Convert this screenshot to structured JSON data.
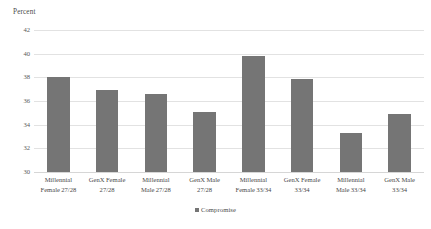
{
  "chart_data": {
    "type": "bar",
    "title": "",
    "subtitle": "",
    "xlabel": "",
    "ylabel": "Percent",
    "ylim": [
      30,
      42
    ],
    "ytick_step": 2,
    "yticks": [
      30,
      32,
      34,
      36,
      38,
      40,
      42
    ],
    "ytick_labels": [
      "30",
      "32",
      "34",
      "36",
      "38",
      "40",
      "42"
    ],
    "grid": true,
    "grid_axis": "y",
    "legend_position": "bottom-center",
    "categories": [
      "Millennial Female 27/28",
      "GenX Female 27/28",
      "Millennial Male 27/28",
      "GenX Male 27/28",
      "Millennial Female 33/34",
      "GenX Female 33/34",
      "Millennial Male 33/34",
      "GenX Male 33/34"
    ],
    "category_lines": [
      [
        "Millennial",
        "Female 27/28"
      ],
      [
        "GenX Female",
        "27/28"
      ],
      [
        "Millennial",
        "Male 27/28"
      ],
      [
        "GenX Male",
        "27/28"
      ],
      [
        "Millennial",
        "Female 33/34"
      ],
      [
        "GenX Female",
        "33/34"
      ],
      [
        "Millennial",
        "Male 33/34"
      ],
      [
        "GenX Male",
        "33/34"
      ]
    ],
    "series": [
      {
        "name": "Compromise",
        "color": "#757575",
        "values": [
          38.0,
          36.9,
          36.6,
          35.1,
          39.8,
          37.9,
          33.3,
          34.9
        ]
      }
    ],
    "legend": [
      {
        "label": "Compromise",
        "color": "#757575"
      }
    ]
  },
  "colors": {
    "bar": "#757575",
    "gridline": "#e2e2e2",
    "baseline": "#d6d6d6",
    "text": "#4a4a4a",
    "background": "#ffffff"
  }
}
